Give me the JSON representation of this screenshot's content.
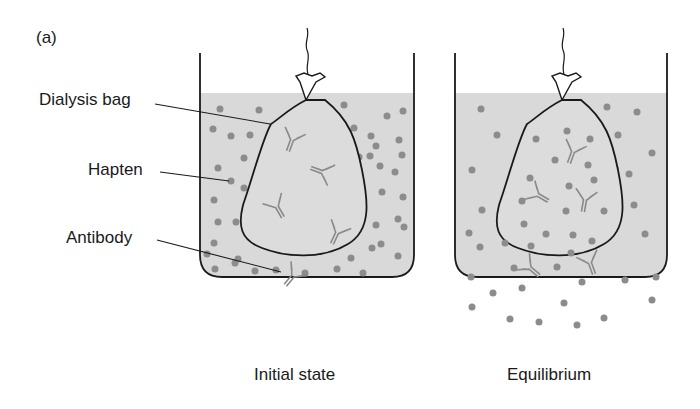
{
  "figure": {
    "panel_label": "(a)",
    "labels": {
      "dialysis_bag": "Dialysis bag",
      "hapten": "Hapten",
      "antibody": "Antibody"
    },
    "panels": [
      {
        "caption": "Initial state",
        "hapten_inside_bag": false
      },
      {
        "caption": "Equilibrium",
        "hapten_inside_bag": true
      }
    ]
  },
  "colors": {
    "fluid": "#d9d9d9",
    "hapten": "#8c8c8c",
    "antibody": "#8a8a8a",
    "outline": "#1a1a1a"
  }
}
